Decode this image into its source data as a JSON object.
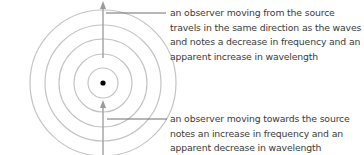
{
  "diagram": {
    "source": {
      "name": "source",
      "cx": 103,
      "cy": 83
    },
    "wavefront_radii": [
      15,
      29,
      44,
      58,
      73
    ],
    "colors": {
      "wavefront": "#c4c4c4",
      "arrow": "#9a9a9a",
      "leader": "#6e6e6e",
      "source": "#000000",
      "text": "#3a3a3a"
    },
    "annotations": [
      {
        "id": "moving-away",
        "text": "an observer moving from the source travels in the same direction as the waves and notes a decrease in frequency and an apparent increase in wavelength"
      },
      {
        "id": "moving-towards",
        "text": "an observer moving towards the source notes an increase in frequency and an apparent decrease in wavelength"
      }
    ]
  }
}
